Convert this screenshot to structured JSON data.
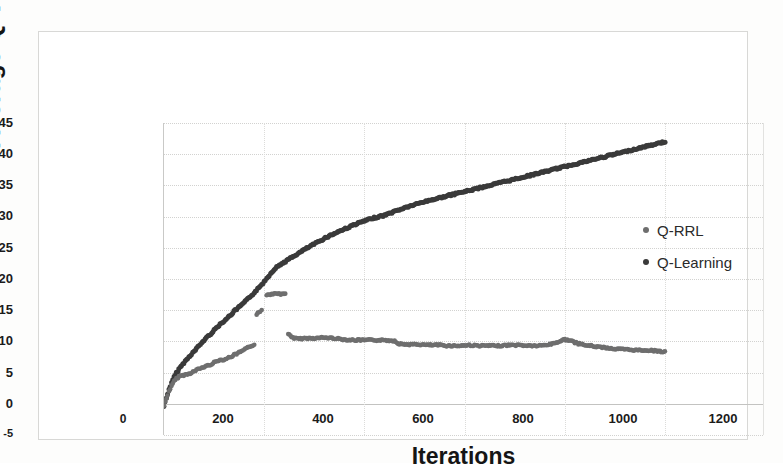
{
  "chart_data": {
    "type": "scatter",
    "title": "",
    "xlabel": "Iterations",
    "ylabel": "Average Q-value",
    "xlim": [
      0,
      1200
    ],
    "ylim": [
      -5,
      45
    ],
    "xticks": [
      "0",
      "200",
      "400",
      "600",
      "800",
      "1000",
      "1200"
    ],
    "yticks": [
      "45",
      "40",
      "35",
      "30",
      "25",
      "20",
      "15",
      "10",
      "5",
      "0",
      "-5"
    ],
    "grid": true,
    "legend_position": "inside-right",
    "legend": [
      "Q-RRL",
      "Q-Learning"
    ],
    "colors": {
      "q_rrl": "#6e6e6e",
      "q_learning": "#3a3a3a",
      "gridline": "#d2d2d0",
      "axis": "#c9c9c7",
      "text": "#1b1b1b"
    },
    "series": [
      {
        "name": "Q-Learning",
        "color": "#3a3a3a",
        "marker": "dot",
        "x": [
          0,
          10,
          20,
          30,
          40,
          50,
          60,
          70,
          80,
          90,
          100,
          110,
          120,
          130,
          140,
          150,
          160,
          170,
          180,
          190,
          200,
          210,
          220,
          230,
          240,
          250,
          260,
          270,
          280,
          300,
          320,
          340,
          360,
          380,
          400,
          420,
          440,
          460,
          480,
          500,
          520,
          540,
          560,
          580,
          600,
          620,
          640,
          660,
          680,
          700,
          720,
          740,
          760,
          780,
          800,
          820,
          840,
          860,
          880,
          900,
          920,
          940,
          960,
          980,
          1000
        ],
        "y": [
          -0.4,
          2.3,
          4.3,
          5.6,
          6.6,
          7.5,
          8.4,
          9.3,
          10.2,
          11.0,
          11.8,
          12.6,
          13.3,
          14.0,
          14.8,
          15.5,
          16.2,
          17.0,
          17.8,
          18.6,
          19.6,
          20.6,
          21.6,
          22.2,
          22.7,
          23.2,
          23.7,
          24.2,
          24.7,
          25.6,
          26.5,
          27.3,
          28.0,
          28.7,
          29.3,
          29.8,
          30.2,
          30.8,
          31.4,
          31.9,
          32.4,
          32.8,
          33.2,
          33.6,
          34.0,
          34.4,
          34.8,
          35.2,
          35.6,
          36.0,
          36.4,
          36.8,
          37.2,
          37.6,
          38.0,
          38.4,
          38.8,
          39.2,
          39.6,
          40.0,
          40.4,
          40.8,
          41.2,
          41.6,
          42.0
        ]
      },
      {
        "name": "Q-RRL",
        "color": "#6e6e6e",
        "marker": "dot",
        "segments": [
          {
            "label": "rise-phase",
            "x": [
              0,
              10,
              20,
              30,
              40,
              50,
              60,
              70,
              80,
              90,
              100,
              110,
              120,
              130,
              140,
              150,
              160,
              170,
              180
            ],
            "y": [
              -0.3,
              2.0,
              3.6,
              4.4,
              4.6,
              4.8,
              5.2,
              5.6,
              5.9,
              6.2,
              6.6,
              7.0,
              7.1,
              7.4,
              7.8,
              8.2,
              8.6,
              9.1,
              9.5
            ]
          },
          {
            "label": "spike-segment-a",
            "x": [
              185,
              190,
              195
            ],
            "y": [
              14.3,
              14.7,
              15.0
            ]
          },
          {
            "label": "spike-segment-b",
            "x": [
              205,
              215,
              225,
              235,
              242
            ],
            "y": [
              17.4,
              17.6,
              17.6,
              17.6,
              17.6
            ]
          },
          {
            "label": "plateau-phase",
            "x": [
              248,
              260,
              270,
              280,
              300,
              320,
              340,
              360,
              380,
              400,
              420,
              440,
              460,
              470,
              490,
              510,
              530,
              550,
              570,
              590,
              610,
              630,
              650,
              670,
              690,
              710,
              730,
              750,
              770,
              790,
              800,
              810,
              820,
              840,
              860,
              880,
              900,
              920,
              940,
              960,
              980,
              1000
            ],
            "y": [
              11.2,
              10.5,
              10.4,
              10.5,
              10.5,
              10.6,
              10.5,
              10.3,
              10.2,
              10.2,
              10.2,
              10.2,
              10.1,
              9.6,
              9.5,
              9.5,
              9.4,
              9.4,
              9.3,
              9.3,
              9.4,
              9.3,
              9.3,
              9.3,
              9.4,
              9.4,
              9.3,
              9.3,
              9.5,
              10.0,
              10.3,
              10.2,
              9.8,
              9.4,
              9.2,
              9.0,
              8.8,
              8.7,
              8.6,
              8.6,
              8.5,
              8.3
            ]
          }
        ]
      }
    ]
  }
}
